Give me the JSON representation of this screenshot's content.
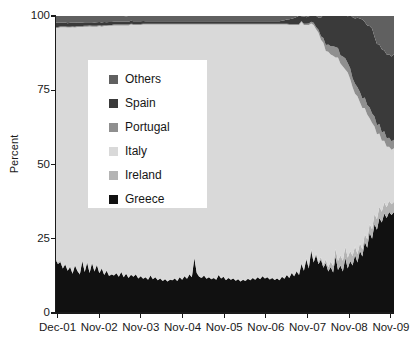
{
  "chart_data": {
    "type": "area",
    "stacked": true,
    "title": "",
    "xlabel": "",
    "ylabel": "Percent",
    "ylim": [
      0,
      100
    ],
    "yticks": [
      0,
      25,
      50,
      75,
      100
    ],
    "ytick_labels": [
      "0",
      "25",
      "50",
      "75",
      "100"
    ],
    "xtick_labels": [
      "Dec-01",
      "Nov-02",
      "Nov-03",
      "Nov-04",
      "Nov-05",
      "Nov-06",
      "Nov-07",
      "Nov-08",
      "Nov-09"
    ],
    "grid": false,
    "legend_position": "upper left inside",
    "legend_entries": [
      "Others",
      "Spain",
      "Portugal",
      "Italy",
      "Ireland",
      "Greece"
    ],
    "series": [
      {
        "name": "Greece",
        "color": "#111111",
        "stack_order": 1,
        "values": [
          18.0,
          16.5,
          17.2,
          15.0,
          16.3,
          14.2,
          15.5,
          13.2,
          16.0,
          14.1,
          13.0,
          17.5,
          13.8,
          17.0,
          13.5,
          16.8,
          14.0,
          16.2,
          13.4,
          15.0,
          12.8,
          14.2,
          12.5,
          13.0,
          12.6,
          13.4,
          12.2,
          13.8,
          12.0,
          13.2,
          11.8,
          12.9,
          12.2,
          13.0,
          11.6,
          12.4,
          11.5,
          12.0,
          11.2,
          12.6,
          11.4,
          12.0,
          11.0,
          11.6,
          10.8,
          11.4,
          10.6,
          11.2,
          11.0,
          11.6,
          10.8,
          12.0,
          11.2,
          12.4,
          11.5,
          13.0,
          12.0,
          18.5,
          13.5,
          12.2,
          11.8,
          12.6,
          11.5,
          12.0,
          11.4,
          11.8,
          11.2,
          12.8,
          11.6,
          12.2,
          11.0,
          11.8,
          11.2,
          11.6,
          10.9,
          11.4,
          10.6,
          11.2,
          10.8,
          11.5,
          11.0,
          11.8,
          11.2,
          12.0,
          11.4,
          12.4,
          11.6,
          12.0,
          11.3,
          11.8,
          11.1,
          11.6,
          11.0,
          12.2,
          11.5,
          12.8,
          11.8,
          13.5,
          12.4,
          14.0,
          12.8,
          16.5,
          14.2,
          18.0,
          15.0,
          21.0,
          17.0,
          19.5,
          16.4,
          18.0,
          15.2,
          16.8,
          14.0,
          15.5,
          13.6,
          19.0,
          14.5,
          16.0,
          14.0,
          18.5,
          15.0,
          17.5,
          16.0,
          19.5,
          17.0,
          21.0,
          19.0,
          24.0,
          22.0,
          27.0,
          25.0,
          30.0,
          28.0,
          32.0,
          30.5,
          33.5,
          32.0,
          34.0,
          33.0,
          34.0
        ]
      },
      {
        "name": "Ireland",
        "color": "#b4b4b4",
        "stack_order": 2,
        "values": [
          0.6,
          0.5,
          0.5,
          0.4,
          0.4,
          0.3,
          0.3,
          0.3,
          0.2,
          0.2,
          0.2,
          0.2,
          0.2,
          0.2,
          0.2,
          0.2,
          0.2,
          0.2,
          0.2,
          0.2,
          0.2,
          0.2,
          0.2,
          0.2,
          0.2,
          0.2,
          0.2,
          0.2,
          0.2,
          0.2,
          0.2,
          0.2,
          0.2,
          0.2,
          0.2,
          0.2,
          0.2,
          0.2,
          0.2,
          0.2,
          0.2,
          0.2,
          0.2,
          0.2,
          0.2,
          0.2,
          0.2,
          0.2,
          0.2,
          0.2,
          0.2,
          0.2,
          0.2,
          0.2,
          0.2,
          0.2,
          0.2,
          0.2,
          0.2,
          0.2,
          0.2,
          0.2,
          0.2,
          0.2,
          0.2,
          0.2,
          0.2,
          0.2,
          0.2,
          0.2,
          0.2,
          0.2,
          0.2,
          0.2,
          0.2,
          0.2,
          0.2,
          0.2,
          0.2,
          0.2,
          0.2,
          0.2,
          0.2,
          0.2,
          0.2,
          0.2,
          0.2,
          0.2,
          0.2,
          0.2,
          0.2,
          0.2,
          0.2,
          0.2,
          0.2,
          0.2,
          0.2,
          0.2,
          0.3,
          0.3,
          0.3,
          0.4,
          0.4,
          0.5,
          0.5,
          0.6,
          0.6,
          0.7,
          0.8,
          0.9,
          1.0,
          1.2,
          1.4,
          1.8,
          2.2,
          2.6,
          3.0,
          3.4,
          3.6,
          3.8,
          3.6,
          3.4,
          3.2,
          3.0,
          2.8,
          2.6,
          2.4,
          2.6,
          2.8,
          3.0,
          3.2,
          3.4,
          3.6,
          3.8,
          3.6,
          3.8,
          3.6,
          3.8,
          3.6,
          3.5
        ]
      },
      {
        "name": "Italy",
        "color": "#d9d9d9",
        "stack_order": 3,
        "values": [
          77.4,
          79.0,
          78.5,
          80.8,
          79.5,
          81.6,
          80.3,
          82.7,
          79.9,
          82.0,
          83.1,
          78.6,
          82.4,
          79.2,
          82.8,
          79.4,
          82.2,
          80.0,
          83.0,
          81.2,
          83.6,
          82.2,
          84.0,
          83.5,
          84.0,
          83.2,
          84.4,
          82.8,
          84.6,
          83.4,
          84.8,
          84.0,
          84.6,
          83.8,
          85.2,
          84.4,
          85.4,
          84.9,
          85.7,
          84.3,
          85.5,
          84.9,
          85.9,
          85.3,
          86.1,
          85.5,
          86.3,
          85.7,
          85.9,
          85.3,
          86.1,
          84.9,
          85.7,
          84.5,
          85.4,
          83.9,
          84.9,
          78.4,
          83.4,
          84.7,
          85.1,
          84.3,
          85.4,
          84.9,
          85.5,
          85.1,
          85.7,
          84.1,
          85.3,
          84.7,
          85.9,
          85.1,
          85.7,
          85.3,
          86.0,
          85.5,
          86.3,
          85.7,
          86.1,
          85.4,
          85.9,
          85.1,
          85.7,
          84.9,
          85.5,
          84.5,
          85.3,
          84.9,
          85.6,
          85.1,
          85.8,
          85.3,
          85.9,
          84.7,
          85.4,
          84.1,
          85.0,
          83.3,
          84.3,
          82.7,
          83.9,
          81.1,
          82.4,
          78.5,
          81.5,
          75.9,
          79.4,
          75.3,
          77.2,
          73.1,
          74.8,
          70.2,
          72.6,
          69.7,
          70.8,
          64.4,
          68.5,
          64.6,
          65.4,
          59.7,
          62.4,
          57.9,
          56.8,
          51.3,
          53.2,
          47.4,
          47.6,
          42.4,
          42.0,
          35.6,
          35.8,
          29.4,
          28.6,
          24.6,
          23.9,
          20.7,
          20.4,
          18.2,
          18.4,
          18.0
        ]
      },
      {
        "name": "Portugal",
        "color": "#8f8f8f",
        "stack_order": 4,
        "values": [
          0.3,
          0.3,
          0.3,
          0.3,
          0.3,
          0.3,
          0.3,
          0.3,
          0.3,
          0.3,
          0.3,
          0.3,
          0.3,
          0.3,
          0.3,
          0.3,
          0.3,
          0.3,
          0.3,
          0.3,
          0.3,
          0.3,
          0.3,
          0.3,
          0.3,
          0.3,
          0.3,
          0.3,
          0.3,
          0.3,
          0.3,
          0.3,
          0.3,
          0.3,
          0.3,
          0.3,
          0.3,
          0.3,
          0.3,
          0.3,
          0.3,
          0.3,
          0.3,
          0.3,
          0.3,
          0.3,
          0.3,
          0.3,
          0.3,
          0.3,
          0.3,
          0.3,
          0.3,
          0.3,
          0.3,
          0.3,
          0.3,
          0.3,
          0.3,
          0.3,
          0.3,
          0.3,
          0.3,
          0.3,
          0.3,
          0.3,
          0.3,
          0.3,
          0.3,
          0.3,
          0.3,
          0.3,
          0.3,
          0.3,
          0.3,
          0.3,
          0.3,
          0.3,
          0.3,
          0.3,
          0.3,
          0.3,
          0.3,
          0.3,
          0.3,
          0.3,
          0.3,
          0.3,
          0.3,
          0.3,
          0.3,
          0.3,
          0.3,
          0.3,
          0.3,
          0.3,
          0.3,
          0.3,
          0.3,
          0.3,
          0.3,
          0.3,
          0.4,
          0.4,
          0.5,
          0.6,
          0.7,
          0.8,
          1.0,
          1.2,
          1.6,
          2.0,
          2.4,
          2.8,
          3.2,
          3.6,
          3.2,
          2.8,
          3.4,
          3.8,
          3.2,
          3.6,
          3.0,
          3.4,
          3.0,
          3.4,
          3.2,
          3.6,
          3.2,
          3.6,
          3.2,
          3.4,
          3.0,
          3.2,
          2.8,
          3.2,
          2.8,
          3.0,
          2.8,
          2.8
        ]
      },
      {
        "name": "Spain",
        "color": "#3a3a3a",
        "stack_order": 5,
        "values": [
          1.5,
          1.4,
          1.3,
          1.3,
          1.3,
          1.2,
          1.3,
          1.2,
          1.3,
          1.2,
          1.2,
          1.2,
          1.2,
          1.2,
          1.1,
          1.2,
          1.1,
          1.2,
          1.1,
          1.1,
          1.1,
          1.0,
          1.0,
          1.0,
          1.0,
          1.0,
          1.0,
          1.0,
          1.0,
          1.0,
          1.0,
          1.0,
          0.9,
          0.9,
          0.9,
          0.9,
          0.9,
          0.8,
          0.8,
          0.8,
          0.8,
          0.8,
          0.8,
          0.8,
          0.8,
          0.8,
          0.8,
          0.8,
          0.8,
          0.8,
          0.8,
          0.8,
          0.8,
          0.8,
          0.8,
          0.8,
          0.8,
          0.8,
          0.8,
          0.8,
          0.8,
          0.8,
          0.8,
          0.8,
          0.8,
          0.8,
          0.8,
          0.8,
          0.8,
          0.8,
          0.8,
          0.8,
          0.8,
          0.8,
          0.8,
          0.8,
          0.8,
          0.8,
          0.8,
          0.8,
          0.8,
          0.8,
          0.8,
          0.8,
          0.8,
          0.8,
          0.8,
          0.8,
          0.8,
          0.8,
          0.8,
          0.8,
          0.8,
          1.0,
          1.2,
          1.4,
          1.6,
          1.8,
          2.0,
          2.4,
          2.8,
          1.6,
          2.4,
          2.2,
          2.4,
          2.0,
          2.4,
          3.8,
          4.0,
          6.2,
          7.8,
          10.0,
          9.8,
          10.6,
          12.8,
          13.0,
          13.4,
          14.8,
          15.4,
          17.0,
          15.6,
          18.0,
          20.6,
          22.0,
          23.4,
          24.8,
          26.6,
          25.4,
          26.8,
          27.4,
          28.6,
          26.8,
          27.4,
          26.8,
          28.0,
          27.2,
          28.2,
          28.0,
          28.6,
          28.8
        ]
      },
      {
        "name": "Others",
        "color": "#606060",
        "stack_order": 6,
        "values": [
          2.2,
          2.3,
          2.2,
          2.2,
          2.2,
          2.4,
          2.3,
          2.3,
          2.3,
          2.2,
          2.2,
          2.2,
          2.1,
          2.1,
          2.1,
          2.1,
          2.2,
          2.1,
          2.0,
          2.2,
          2.0,
          2.1,
          2.0,
          2.0,
          1.9,
          1.9,
          1.9,
          1.9,
          1.9,
          1.8,
          1.9,
          1.7,
          1.8,
          1.8,
          1.8,
          1.8,
          1.7,
          1.8,
          1.8,
          2.0,
          1.8,
          1.8,
          1.8,
          1.8,
          1.8,
          1.8,
          1.8,
          1.8,
          1.8,
          1.8,
          1.8,
          1.9,
          1.8,
          1.8,
          1.8,
          1.8,
          1.8,
          1.8,
          1.8,
          1.8,
          1.8,
          1.8,
          1.8,
          1.8,
          1.8,
          1.8,
          1.8,
          1.8,
          1.8,
          1.8,
          1.8,
          1.8,
          1.8,
          1.8,
          1.8,
          1.8,
          1.8,
          1.8,
          1.8,
          1.8,
          1.8,
          1.8,
          1.8,
          1.8,
          1.8,
          1.8,
          1.8,
          1.8,
          1.8,
          1.8,
          1.8,
          1.8,
          1.8,
          1.8,
          1.4,
          1.2,
          1.1,
          1.0,
          0.8,
          0.8,
          0.8,
          1.6,
          1.4,
          0.9,
          0.8,
          1.8,
          1.0,
          1.0,
          1.4,
          1.2,
          1.4,
          1.6,
          2.0,
          2.4,
          3.6,
          3.4,
          4.0,
          3.8,
          4.2,
          4.8,
          5.6,
          6.0,
          6.4,
          7.2,
          7.6,
          8.6,
          9.0,
          10.2,
          10.6,
          11.0,
          11.2,
          12.8,
          13.6,
          14.4,
          14.4,
          15.2,
          15.4,
          15.8,
          15.8,
          15.4
        ]
      }
    ]
  },
  "axis": {
    "y_label": "Percent",
    "y_ticks": [
      "100",
      "75",
      "50",
      "25",
      "0"
    ],
    "x_ticks": [
      "Dec-01",
      "Nov-02",
      "Nov-03",
      "Nov-04",
      "Nov-05",
      "Nov-06",
      "Nov-07",
      "Nov-08",
      "Nov-09"
    ]
  },
  "legend": {
    "items": [
      {
        "label": "Others",
        "color": "#606060"
      },
      {
        "label": "Spain",
        "color": "#3a3a3a"
      },
      {
        "label": "Portugal",
        "color": "#8f8f8f"
      },
      {
        "label": "Italy",
        "color": "#d9d9d9"
      },
      {
        "label": "Ireland",
        "color": "#b4b4b4"
      },
      {
        "label": "Greece",
        "color": "#111111"
      }
    ]
  }
}
